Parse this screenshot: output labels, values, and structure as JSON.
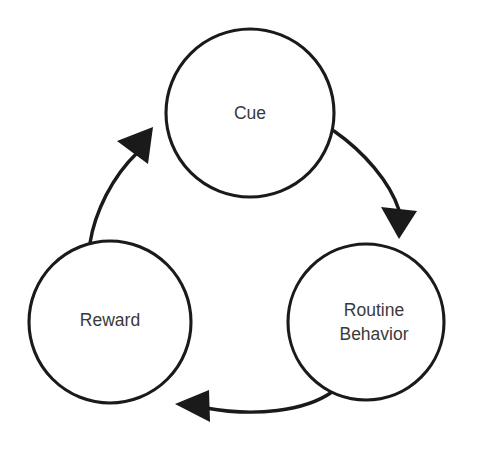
{
  "diagram": {
    "colors": {
      "background": "#ffffff",
      "stroke": "#1a1a1a",
      "text": "#3a3a3a"
    },
    "nodes": [
      {
        "id": "cue",
        "label": "Cue",
        "lines": [
          "Cue"
        ],
        "cx": 250,
        "cy": 113,
        "r": 84
      },
      {
        "id": "routine-behavior",
        "label": "Routine Behavior",
        "lines": [
          "Routine",
          "Behavior"
        ],
        "cx": 366,
        "cy": 322,
        "r": 78
      },
      {
        "id": "reward",
        "label": "Reward",
        "lines": [
          "Reward"
        ],
        "cx": 110,
        "cy": 322,
        "r": 81
      }
    ],
    "arrows": [
      {
        "id": "cue-to-routine",
        "from": "cue",
        "to": "routine-behavior",
        "direction": "down-right"
      },
      {
        "id": "routine-to-reward",
        "from": "routine-behavior",
        "to": "reward",
        "direction": "left"
      },
      {
        "id": "reward-to-cue",
        "from": "reward",
        "to": "cue",
        "direction": "up-right"
      }
    ]
  }
}
